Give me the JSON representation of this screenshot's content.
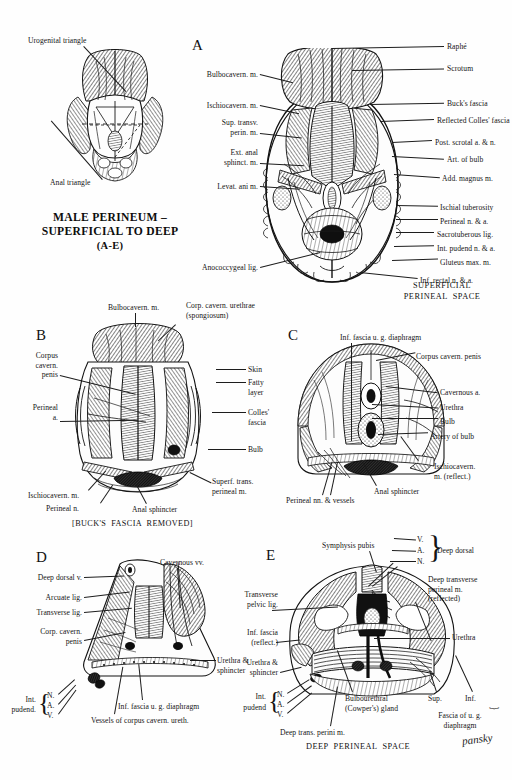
{
  "plate": {
    "title_line1": "MALE PERINEUM –",
    "title_line2": "SUPERFICIAL TO DEEP",
    "title_line3": "(A-E)",
    "signature": "pansky"
  },
  "orientation_figure": {
    "label_urogenital": "Urogenital triangle",
    "label_anal": "Anal triangle"
  },
  "panel_a": {
    "letter": "A",
    "caption_line1": "SUPERFICIAL",
    "caption_line2": "PERINEAL  SPACE",
    "labels_left": [
      "Bulbocavern. m.",
      "Ischiocavern. m.",
      "Sup. transv.\nperin. m.",
      "Ext. anal\nsphinct. m.",
      "Levat. ani m.",
      "Anococcygeal lig."
    ],
    "labels_right": [
      "Raphé",
      "Scrotum",
      "Buck's fascia",
      "Reflected Colles' fascia",
      "Post. scrotal a. & n.",
      "Art. of bulb",
      "Add. magnus m.",
      "Ischial tuberosity",
      "Perineal n. & a.",
      "Sacrotuberous lig.",
      "Int. pudend n. & a.",
      "Gluteus max. m.",
      "Inf. rectal n. & a."
    ]
  },
  "panel_b": {
    "letter": "B",
    "caption": "[BUCK'S  FASCIA  REMOVED]",
    "label_top_1": "Bulbocavern. m.",
    "label_top_2": "Corp. cavern. urethrae\n(spongiosum)",
    "labels_left": [
      "Corpus\ncavern.\npenis",
      "Perineal\na.",
      "Ischiocavern. m.",
      "Perineal n."
    ],
    "labels_right": [
      "Skin",
      "Fatty\nlayer",
      "Colles'\nfascia",
      "Bulb",
      "Superf. trans.\nperineal m."
    ],
    "label_bottom": "Anal sphincter"
  },
  "panel_c": {
    "letter": "C",
    "label_top": "Inf. fascia u. g. diaphragm",
    "labels_right": [
      "Corpus cavern. penis",
      "Cavernous a.",
      "Urethra",
      "Bulb",
      "Artery of bulb",
      "Ischiocavern.\nm. (reflect.)"
    ],
    "labels_bottom": [
      "Perineal nn. & vessels",
      "Anal sphincter"
    ]
  },
  "panel_d": {
    "letter": "D",
    "label_top": "Cavernous vv.",
    "labels_left": [
      "Deep dorsal v.",
      "Arcuate lig.",
      "Transverse lig.",
      "Corp. cavern.\npenis"
    ],
    "labels_right": [
      "Urethra &\nsphincter"
    ],
    "brace_group": {
      "title_line1": "Int.",
      "title_line2": "pudend.",
      "items": [
        "N.",
        "A.",
        "V."
      ]
    },
    "labels_bottom": [
      "Inf. fascia u. g. diaphragm",
      "Vessels of corpus cavern. ureth."
    ]
  },
  "panel_e": {
    "letter": "E",
    "caption": "DEEP  PERINEAL  SPACE",
    "label_symphysis": "Symphysis pubis",
    "deep_dorsal": {
      "items": [
        "V.",
        "A.",
        "N."
      ],
      "title": "Deep dorsal"
    },
    "labels_right": [
      "Deep transverse\nperineal m.\n(reflected)",
      "Urethra"
    ],
    "labels_left": [
      "Transverse\npelvic lig.",
      "Inf. fascia\n(reflect.)",
      "Urethra &\nsphincter"
    ],
    "pudend_group": {
      "title_line1": "Int.",
      "title_line2": "pudend",
      "items": [
        "N.",
        "A.",
        "V."
      ]
    },
    "labels_bottom": [
      "Bulbourethral\n(Cowper's) gland",
      "Deep trans. perini m."
    ],
    "fascia_group": {
      "sup": "Sup.",
      "inf": "Inf.",
      "caption_line1": "Fascia of u. g.",
      "caption_line2": "diaphragm"
    }
  },
  "colors": {
    "ink": "#141414",
    "paper": "#fefefe"
  }
}
